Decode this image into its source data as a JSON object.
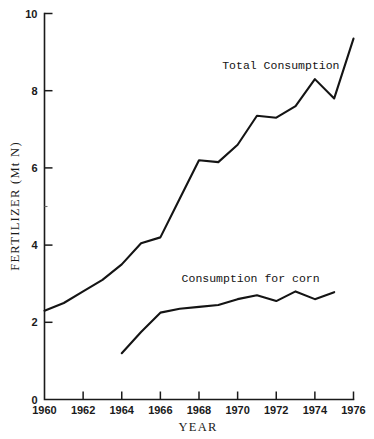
{
  "chart_data": {
    "type": "line",
    "title": "",
    "xlabel": "YEAR",
    "ylabel": "FERTILIZER (Mt N)",
    "xlim": [
      1960,
      1976
    ],
    "ylim": [
      0,
      10
    ],
    "grid": false,
    "legend_position": "inline-annotations",
    "x_ticks": [
      1960,
      1962,
      1964,
      1966,
      1968,
      1970,
      1972,
      1974,
      1976
    ],
    "x_tick_labels": [
      "1960",
      "1962",
      "1964",
      "1966",
      "1968",
      "1970",
      "1972",
      "1974",
      "1976"
    ],
    "y_ticks": [
      0,
      2,
      4,
      6,
      8,
      10
    ],
    "y_tick_labels": [
      "0",
      "2",
      "4",
      "6",
      "8",
      "10"
    ],
    "series": [
      {
        "name": "Total Consumption",
        "label_x": 1969.2,
        "label_y": 8.55,
        "x": [
          1960,
          1961,
          1962,
          1963,
          1964,
          1965,
          1966,
          1967,
          1968,
          1969,
          1970,
          1971,
          1972,
          1973,
          1974,
          1975,
          1976
        ],
        "values": [
          2.3,
          2.5,
          2.8,
          3.1,
          3.5,
          4.05,
          4.2,
          5.2,
          6.2,
          6.15,
          6.6,
          7.35,
          7.3,
          7.6,
          8.3,
          7.8,
          9.35
        ]
      },
      {
        "name": "Consumption for corn",
        "label_x": 1967.1,
        "label_y": 3.05,
        "x": [
          1964,
          1965,
          1966,
          1967,
          1968,
          1969,
          1970,
          1971,
          1972,
          1973,
          1974,
          1975
        ],
        "values": [
          1.2,
          1.75,
          2.25,
          2.35,
          2.4,
          2.45,
          2.6,
          2.7,
          2.55,
          2.8,
          2.6,
          2.78
        ]
      }
    ]
  },
  "annotations": {
    "total_consumption_label": "Total Consumption",
    "corn_consumption_label": "Consumption for corn"
  }
}
